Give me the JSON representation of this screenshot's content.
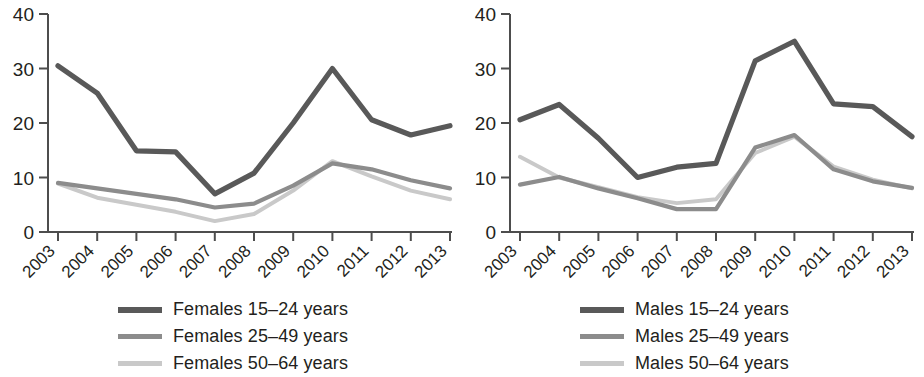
{
  "chart_data": [
    {
      "type": "line",
      "title": "",
      "panel": "left",
      "xlabel": "",
      "ylabel": "",
      "x": [
        2003,
        2004,
        2005,
        2006,
        2007,
        2008,
        2009,
        2010,
        2011,
        2012,
        2013
      ],
      "categories": [
        "2003",
        "2004",
        "2005",
        "2006",
        "2007",
        "2008",
        "2009",
        "2010",
        "2011",
        "2012",
        "2013"
      ],
      "ylim": [
        0,
        40
      ],
      "yticks": [
        0,
        10,
        20,
        30,
        40
      ],
      "grid": false,
      "legend_position": "bottom",
      "series": [
        {
          "name": "Females 15–24 years",
          "color": "#595959",
          "values": [
            30.5,
            25.5,
            14.9,
            14.7,
            7.0,
            10.8,
            20.0,
            30.0,
            20.6,
            17.8,
            19.5
          ]
        },
        {
          "name": "Females 25–49 years",
          "color": "#8c8c8c",
          "values": [
            9.0,
            8.0,
            7.0,
            6.0,
            4.5,
            5.2,
            8.5,
            12.6,
            11.5,
            9.5,
            8.0
          ]
        },
        {
          "name": "Females 50–64 years",
          "color": "#c9c9c9",
          "values": [
            8.9,
            6.3,
            5.0,
            3.7,
            2.0,
            3.3,
            7.6,
            13.0,
            10.2,
            7.6,
            6.0
          ]
        }
      ]
    },
    {
      "type": "line",
      "title": "",
      "panel": "right",
      "xlabel": "",
      "ylabel": "",
      "x": [
        2003,
        2004,
        2005,
        2006,
        2007,
        2008,
        2009,
        2010,
        2011,
        2012,
        2013
      ],
      "categories": [
        "2003",
        "2004",
        "2005",
        "2006",
        "2007",
        "2008",
        "2009",
        "2010",
        "2011",
        "2012",
        "2013"
      ],
      "ylim": [
        0,
        40
      ],
      "yticks": [
        0,
        10,
        20,
        30,
        40
      ],
      "grid": false,
      "legend_position": "bottom",
      "series": [
        {
          "name": "Males 15–24 years",
          "color": "#595959",
          "values": [
            20.6,
            23.4,
            17.2,
            10.0,
            11.9,
            12.6,
            31.4,
            35.0,
            23.5,
            23.0,
            17.5
          ]
        },
        {
          "name": "Males 25–49 years",
          "color": "#8c8c8c",
          "values": [
            8.7,
            10.1,
            8.0,
            6.2,
            4.2,
            4.2,
            15.5,
            17.8,
            11.5,
            9.3,
            8.1
          ]
        },
        {
          "name": "Males 50–64 years",
          "color": "#c9c9c9",
          "values": [
            13.8,
            10.0,
            8.2,
            6.4,
            5.3,
            6.0,
            14.5,
            17.5,
            12.0,
            9.6,
            8.0
          ]
        }
      ]
    }
  ],
  "panels": [
    {
      "id": "females",
      "yticks": [
        "0",
        "10",
        "20",
        "30",
        "40"
      ],
      "xticks": [
        "2003",
        "2004",
        "2005",
        "2006",
        "2007",
        "2008",
        "2009",
        "2010",
        "2011",
        "2012",
        "2013"
      ],
      "legend": [
        {
          "label": "Females 15–24 years",
          "color": "#595959"
        },
        {
          "label": "Females 25–49 years",
          "color": "#8c8c8c"
        },
        {
          "label": "Females 50–64 years",
          "color": "#c9c9c9"
        }
      ]
    },
    {
      "id": "males",
      "yticks": [
        "0",
        "10",
        "20",
        "30",
        "40"
      ],
      "xticks": [
        "2003",
        "2004",
        "2005",
        "2006",
        "2007",
        "2008",
        "2009",
        "2010",
        "2011",
        "2012",
        "2013"
      ],
      "legend": [
        {
          "label": "Males 15–24 years",
          "color": "#595959"
        },
        {
          "label": "Males 25–49 years",
          "color": "#8c8c8c"
        },
        {
          "label": "Males 50–64 years",
          "color": "#c9c9c9"
        }
      ]
    }
  ],
  "colors": {
    "axis": "#4d4d4d",
    "text": "#231f20",
    "series_dark": "#595959",
    "series_mid": "#8c8c8c",
    "series_light": "#c9c9c9",
    "background": "#ffffff"
  }
}
